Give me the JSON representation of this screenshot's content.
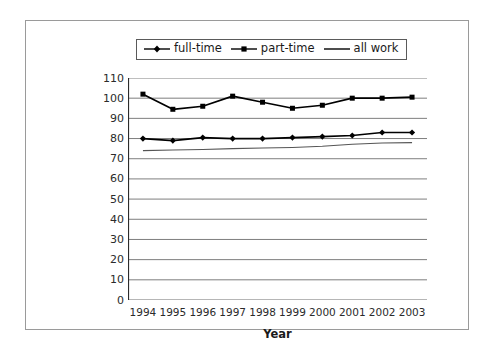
{
  "chart_data": {
    "type": "line",
    "title": "",
    "xlabel": "Year",
    "ylabel": "",
    "grid": true,
    "legend_position": "top-center",
    "categories": [
      "1994",
      "1995",
      "1996",
      "1997",
      "1998",
      "1999",
      "2000",
      "2001",
      "2002",
      "2003"
    ],
    "ylim": [
      0,
      110
    ],
    "yticks": [
      "110",
      "100",
      "90",
      "80",
      "70",
      "60",
      "50",
      "40",
      "30",
      "20",
      "10",
      "0"
    ],
    "series": [
      {
        "name": "full-time",
        "marker": "diamond",
        "color": "#000000",
        "values": [
          80,
          79,
          80.5,
          80,
          80,
          80.5,
          81,
          81.5,
          83,
          83
        ]
      },
      {
        "name": "part-time",
        "marker": "square",
        "color": "#000000",
        "values": [
          102,
          94.5,
          96,
          101,
          98,
          95,
          96.5,
          100,
          100,
          100.5
        ]
      },
      {
        "name": "all work",
        "marker": "none",
        "color": "#555555",
        "values": [
          74,
          74.3,
          74.6,
          75,
          75.3,
          75.6,
          76.2,
          77.2,
          77.8,
          78
        ]
      }
    ]
  },
  "legend": {
    "items": [
      {
        "label": "full-time",
        "marker": "diamond"
      },
      {
        "label": "part-time",
        "marker": "square"
      },
      {
        "label": "all work",
        "marker": "none"
      }
    ]
  }
}
